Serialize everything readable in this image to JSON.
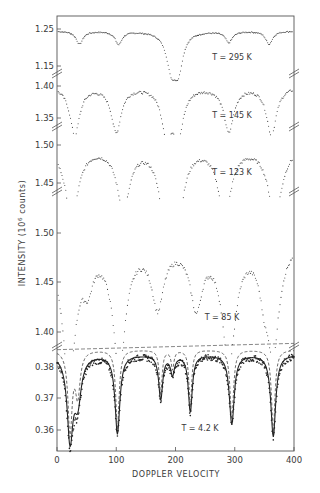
{
  "chart_data": {
    "type": "scatter",
    "title": "",
    "xlabel": "DOPPLER VELOCITY",
    "ylabel": "INTENSITY (10^6 counts)",
    "ylabel_display": "INTENSITY (10",
    "ylabel_sup": "6",
    "ylabel_tail": " counts)",
    "xlim": [
      0,
      400
    ],
    "x_ticks": [
      0,
      100,
      200,
      300,
      400
    ],
    "x_tick_labels": [
      "0",
      "100",
      "200",
      "300",
      "400"
    ],
    "grid": false,
    "legend": null,
    "layout": "stacked panels with broken y-axis",
    "panels": [
      {
        "label": "T = 295 K",
        "y_ticks": [
          1.25,
          1.15
        ],
        "y_tick_labels": [
          "1.25",
          "1.15"
        ],
        "baseline": 1.245,
        "dips": [
          {
            "x": 38,
            "depth": 0.035,
            "width": 7
          },
          {
            "x": 104,
            "depth": 0.035,
            "width": 7
          },
          {
            "x": 193,
            "depth": 0.095,
            "width": 10
          },
          {
            "x": 205,
            "depth": 0.09,
            "width": 9
          },
          {
            "x": 290,
            "depth": 0.03,
            "width": 7
          },
          {
            "x": 358,
            "depth": 0.035,
            "width": 7
          }
        ]
      },
      {
        "label": "T = 145 K",
        "y_ticks": [
          1.4,
          1.35
        ],
        "y_tick_labels": [
          "1.40",
          "1.35"
        ],
        "baseline": 1.4,
        "dips": [
          {
            "x": 30,
            "depth": 0.075,
            "width": 10
          },
          {
            "x": 100,
            "depth": 0.07,
            "width": 10
          },
          {
            "x": 185,
            "depth": 0.07,
            "width": 10
          },
          {
            "x": 205,
            "depth": 0.07,
            "width": 10
          },
          {
            "x": 290,
            "depth": 0.07,
            "width": 10
          },
          {
            "x": 362,
            "depth": 0.075,
            "width": 10
          }
        ]
      },
      {
        "label": "T = 123 K",
        "y_ticks": [
          1.5,
          1.45
        ],
        "y_tick_labels": [
          "1.50",
          "1.45"
        ],
        "baseline": 1.5,
        "dips": [
          {
            "x": 25,
            "depth": 0.09,
            "width": 14
          },
          {
            "x": 112,
            "depth": 0.08,
            "width": 13
          },
          {
            "x": 180,
            "depth": 0.07,
            "width": 12
          },
          {
            "x": 205,
            "depth": 0.08,
            "width": 12
          },
          {
            "x": 283,
            "depth": 0.09,
            "width": 13
          },
          {
            "x": 368,
            "depth": 0.09,
            "width": 14
          }
        ]
      },
      {
        "label": "T = 85 K",
        "y_ticks": [
          1.5,
          1.45,
          1.4
        ],
        "y_tick_labels": [
          "1.50",
          "1.45",
          "1.40"
        ],
        "baseline": 1.49,
        "dips": [
          {
            "x": 20,
            "depth": 0.13,
            "width": 14
          },
          {
            "x": 52,
            "depth": 0.03,
            "width": 10
          },
          {
            "x": 105,
            "depth": 0.12,
            "width": 13
          },
          {
            "x": 170,
            "depth": 0.06,
            "width": 12
          },
          {
            "x": 235,
            "depth": 0.06,
            "width": 12
          },
          {
            "x": 290,
            "depth": 0.12,
            "width": 13
          },
          {
            "x": 350,
            "depth": 0.035,
            "width": 10
          },
          {
            "x": 365,
            "depth": 0.1,
            "width": 12
          }
        ]
      },
      {
        "label": "T = 4.2 K",
        "y_ticks": [
          0.38,
          0.37,
          0.36
        ],
        "y_tick_labels": [
          "0.38",
          "0.37",
          "0.36"
        ],
        "baseline": 0.384,
        "dips": [
          {
            "x": 22,
            "depth": 0.026,
            "width": 6
          },
          {
            "x": 35,
            "depth": 0.014,
            "width": 7
          },
          {
            "x": 102,
            "depth": 0.025,
            "width": 5
          },
          {
            "x": 175,
            "depth": 0.014,
            "width": 4
          },
          {
            "x": 195,
            "depth": 0.006,
            "width": 4
          },
          {
            "x": 225,
            "depth": 0.018,
            "width": 4
          },
          {
            "x": 295,
            "depth": 0.022,
            "width": 5
          },
          {
            "x": 365,
            "depth": 0.026,
            "width": 5
          }
        ],
        "fit_curves": 2
      }
    ]
  }
}
